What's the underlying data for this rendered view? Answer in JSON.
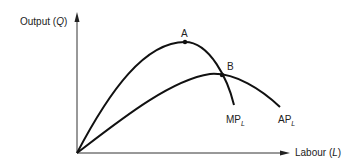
{
  "diagram": {
    "y_axis": {
      "label": "Output",
      "symbol": "Q"
    },
    "x_axis": {
      "label": "Labour",
      "symbol": "L"
    },
    "curves": [
      {
        "id": "MP",
        "label": "MP",
        "subscript": "L"
      },
      {
        "id": "AP",
        "label": "AP",
        "subscript": "L"
      }
    ],
    "points": [
      {
        "id": "A",
        "label": "A"
      },
      {
        "id": "B",
        "label": "B"
      }
    ],
    "stroke_color": "#111111"
  }
}
